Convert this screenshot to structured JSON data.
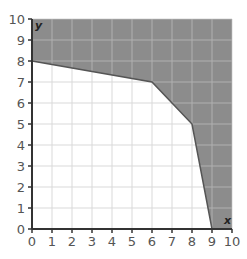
{
  "chart_data": {
    "type": "area",
    "title": "",
    "xlabel": "x",
    "ylabel": "y",
    "xlim": [
      0,
      10
    ],
    "ylim": [
      0,
      10
    ],
    "grid": true,
    "x_ticks": [
      0,
      1,
      2,
      3,
      4,
      5,
      6,
      7,
      8,
      9,
      10
    ],
    "y_ticks": [
      0,
      1,
      2,
      3,
      4,
      5,
      6,
      7,
      8,
      9,
      10
    ],
    "boundary": {
      "description": "Piecewise-linear boundary; region above/right of it (within 0..10) is shaded",
      "points": [
        [
          0,
          8
        ],
        [
          6,
          7
        ],
        [
          8,
          5
        ],
        [
          9,
          0
        ]
      ]
    },
    "shaded_region": [
      [
        0,
        8
      ],
      [
        6,
        7
      ],
      [
        8,
        5
      ],
      [
        9,
        0
      ],
      [
        10,
        0
      ],
      [
        10,
        10
      ],
      [
        0,
        10
      ]
    ],
    "colors": {
      "shaded": "#8c8c8c",
      "grid": "#d9d9d9",
      "grid_on_shaded": "#b0b0b0",
      "axis": "#333333",
      "boundary": "#555555"
    }
  }
}
